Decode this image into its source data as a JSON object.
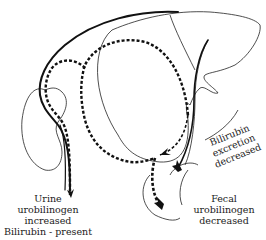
{
  "diagram": {
    "colors": {
      "line": "#111111",
      "organ_outline": "#222222",
      "background": "#ffffff"
    },
    "structures": [
      "liver",
      "gallbladder",
      "kidney",
      "ureter",
      "intestine",
      "bile-duct"
    ],
    "labels": {
      "urine": {
        "line1": "Urine",
        "line2": "urobilinogen",
        "line3": "increased",
        "line4": "Bilirubin - present"
      },
      "excretion": {
        "line1": "Bilirubin",
        "line2": "excretion",
        "line3": "decreased"
      },
      "fecal": {
        "line1": "Fecal",
        "line2": "urobilinogen",
        "line3": "decreased"
      }
    }
  }
}
